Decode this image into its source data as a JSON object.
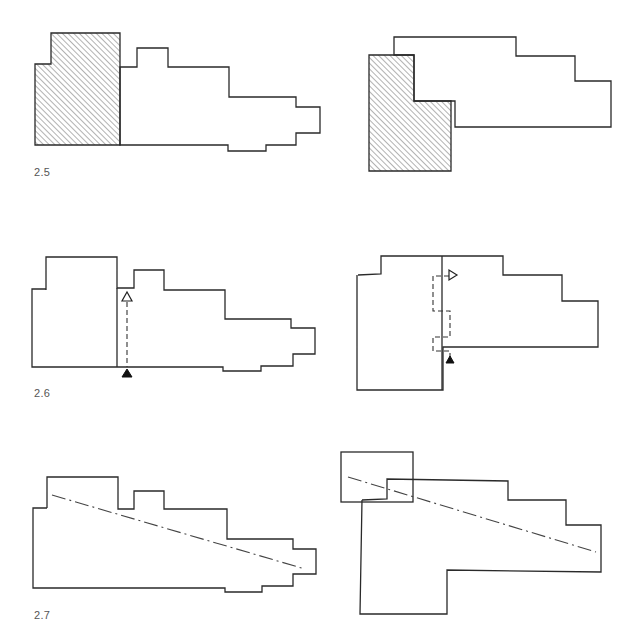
{
  "figures": [
    {
      "id": "2.5",
      "label": "2.5",
      "description": "Two floor plans with hatched shaded blocks indicating a highlighted volume"
    },
    {
      "id": "2.6",
      "label": "2.6",
      "description": "Two floor plans with a dashed path between open and solid triangle markers"
    },
    {
      "id": "2.7",
      "label": "2.7",
      "description": "Two floor plans with a dash-dot diagonal axis line"
    }
  ],
  "colors": {
    "stroke": "#2a2a2a",
    "hatch": "#555555",
    "background": "#ffffff"
  },
  "icons": {
    "open_triangle": "open-triangle-marker",
    "solid_triangle": "solid-triangle-marker"
  }
}
